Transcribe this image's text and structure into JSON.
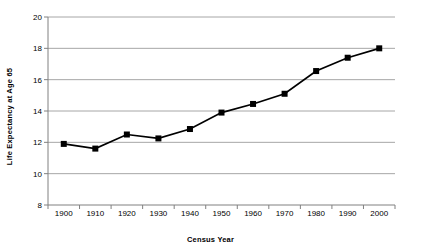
{
  "chart_data": {
    "type": "line",
    "title": "",
    "xlabel": "Census Year",
    "ylabel": "Life Expectancy at Age 65",
    "categories": [
      "1900",
      "1910",
      "1920",
      "1930",
      "1940",
      "1950",
      "1960",
      "1970",
      "1980",
      "1990",
      "2000"
    ],
    "series": [
      {
        "name": "Life Expectancy at Age 65",
        "values": [
          11.9,
          11.6,
          12.5,
          12.25,
          12.85,
          13.9,
          14.45,
          15.1,
          16.55,
          17.4,
          18.0
        ]
      }
    ],
    "ylim": [
      8,
      20
    ],
    "ytick_labels": [
      "8",
      "10",
      "12",
      "14",
      "16",
      "18",
      "20"
    ],
    "ytick_values": [
      8,
      10,
      12,
      14,
      16,
      18,
      20
    ],
    "xlim_categories": 11,
    "grid": "horizontal",
    "legend": "none",
    "marker": "square",
    "colors": {
      "line": "#000000",
      "marker": "#000000",
      "grid": "#a6a6a6",
      "axis": "#808080",
      "background": "#ffffff",
      "text": "#000000"
    }
  }
}
